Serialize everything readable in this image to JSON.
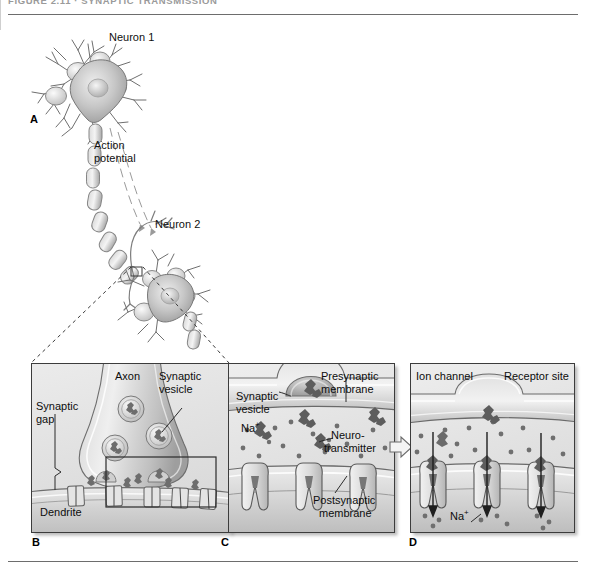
{
  "figure": {
    "caption": "FIGURE 2.11  ·  SYNAPTIC TRANSMISSION",
    "width": 590,
    "height": 571
  },
  "panel_a": {
    "letter": "A",
    "labels": {
      "neuron1": "Neuron 1",
      "neuron2": "Neuron 2",
      "action_potential_line1": "Action",
      "action_potential_line2": "potential"
    }
  },
  "panel_b": {
    "letter": "B",
    "labels": {
      "axon": "Axon",
      "synaptic_vesicle_line1": "Synaptic",
      "synaptic_vesicle_line2": "vesicle",
      "synaptic_gap_line1": "Synaptic",
      "synaptic_gap_line2": "gap",
      "dendrite": "Dendrite"
    }
  },
  "panel_c": {
    "letter": "C",
    "labels": {
      "synaptic_vesicle_line1": "Synaptic",
      "synaptic_vesicle_line2": "vesicle",
      "presynaptic_line1": "Presynaptic",
      "presynaptic_line2": "membrane",
      "sodium_ion": "Na",
      "sodium_charge": "+",
      "neurotransmitter_line1": "Neuro-",
      "neurotransmitter_line2": "transmitter",
      "postsynaptic_line1": "Postsynaptic",
      "postsynaptic_line2": "membrane"
    }
  },
  "panel_d": {
    "letter": "D",
    "labels": {
      "ion_channel": "Ion channel",
      "receptor_site": "Receptor site",
      "sodium_ion": "Na",
      "sodium_charge": "+"
    }
  },
  "colors": {
    "panel_fill": "#e2e2e2",
    "panel_border": "#3c3c3c",
    "rule": "#6d6d6d",
    "membrane_light": "#f3f3f3",
    "membrane_mid": "#c9c9c9",
    "membrane_dark": "#8e8e8e",
    "cell_body": "#bdbdbd",
    "text": "#101010"
  }
}
